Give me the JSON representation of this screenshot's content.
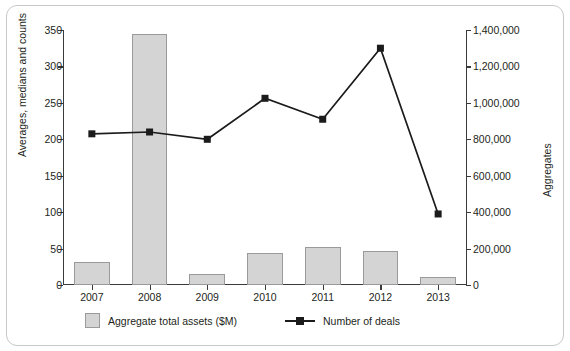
{
  "chart_data": {
    "type": "bar",
    "title": "",
    "xlabel": "",
    "ylabel": "Averages, medians and counts",
    "y2label": "Aggregates",
    "categories": [
      "2007",
      "2008",
      "2009",
      "2010",
      "2011",
      "2012",
      "2013"
    ],
    "ylim": [
      0,
      350
    ],
    "y2lim": [
      0,
      1400000
    ],
    "yticks": [
      "0",
      "50",
      "100",
      "150",
      "200",
      "250",
      "300",
      "350"
    ],
    "ytick_values": [
      0,
      50,
      100,
      150,
      200,
      250,
      300,
      350
    ],
    "y2ticks": [
      "0",
      "200,000",
      "400,000",
      "600,000",
      "800,000",
      "1,000,000",
      "1,200,000",
      "1,400,000"
    ],
    "y2tick_values": [
      0,
      200000,
      400000,
      600000,
      800000,
      1000000,
      1200000,
      1400000
    ],
    "grid": false,
    "legend_position": "bottom",
    "series": [
      {
        "name": "Aggregate total assets ($M)",
        "type": "bar",
        "axis": "left",
        "color": "#d4d4d4",
        "edge_color": "#9a9a9a",
        "values": [
          31,
          344,
          15,
          44,
          52,
          46,
          11
        ]
      },
      {
        "name": "Number of deals",
        "type": "line",
        "axis": "right",
        "color": "#1b1b1b",
        "marker": "square",
        "values": [
          830000,
          840000,
          800000,
          1025000,
          910000,
          1300000,
          390000
        ]
      }
    ]
  },
  "legend": {
    "items": [
      {
        "label": "Aggregate total assets ($M)",
        "marker": "bar-swatch-icon"
      },
      {
        "label": "Number of deals",
        "marker": "line-marker-icon"
      }
    ]
  }
}
